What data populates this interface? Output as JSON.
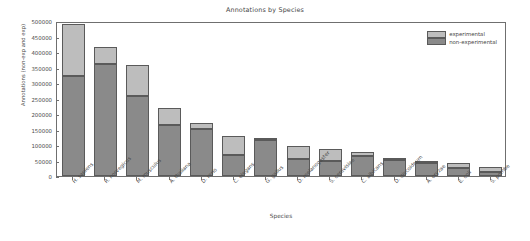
{
  "chart_data": {
    "type": "bar",
    "title": "Annotations by Species",
    "xlabel": "Species",
    "ylabel": "Annotations (non-exp and exp)",
    "stacked": true,
    "grid": false,
    "legend_position": "upper right",
    "ylim": [
      0,
      500000
    ],
    "yticks": [
      0,
      50000,
      100000,
      150000,
      200000,
      250000,
      300000,
      350000,
      400000,
      450000,
      500000
    ],
    "ytick_labels": [
      "0",
      "50000",
      "100000",
      "150000",
      "200000",
      "250000",
      "300000",
      "350000",
      "400000",
      "450000",
      "500000"
    ],
    "categories": [
      "H. sapiens",
      "R. norvegicus",
      "M. musculus",
      "A. thaliana",
      "D. rerio",
      "C. elegans",
      "G. gallus",
      "D. melanogaster",
      "S. cerevisiae",
      "C. albicans",
      "D. discoideum",
      "A. oryzae",
      "E. coli",
      "S. pombe"
    ],
    "series": [
      {
        "name": "non-experimental",
        "color": "#8a8a8a",
        "values": [
          322000,
          360000,
          259000,
          163000,
          152000,
          68000,
          117000,
          54000,
          47000,
          66000,
          53000,
          42000,
          25000,
          12000
        ]
      },
      {
        "name": "experimental",
        "color": "#bdbdbd",
        "values": [
          167000,
          55000,
          98000,
          58000,
          18000,
          62000,
          2000,
          44000,
          41000,
          13000,
          3000,
          1000,
          17000,
          17000
        ]
      }
    ],
    "totals": [
      489000,
      415000,
      357000,
      221000,
      170000,
      130000,
      119000,
      98000,
      88000,
      79000,
      56000,
      43000,
      42000,
      29000
    ]
  },
  "legend": {
    "entries": [
      {
        "label": "experimental",
        "color": "#bdbdbd"
      },
      {
        "label": "non-experimental",
        "color": "#8a8a8a"
      }
    ]
  }
}
